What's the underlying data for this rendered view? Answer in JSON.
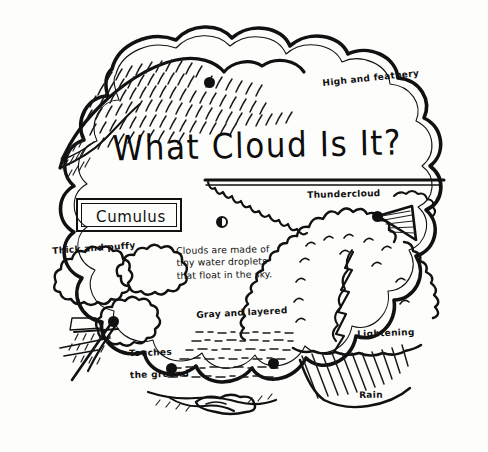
{
  "page": {
    "kind": "hand-drawn cloud identification wheel worksheet",
    "background_color": "#fdfdfb",
    "ink_color": "#111111"
  },
  "title": {
    "text": "What Cloud Is It?"
  },
  "selected_type_box": {
    "label": "Cumulus"
  },
  "center_note": {
    "line1": "Clouds are made of",
    "line2": "tiny water droplets",
    "line3": "that float in the sky."
  },
  "labels": {
    "high_and_feathery": "High and feathery",
    "thundercloud": "Thundercloud",
    "thick_and_puffy": "Thick and puffy",
    "touches_the_ground_line1": "Touches",
    "touches_the_ground_line2": "the ground",
    "gray_and_layered": "Gray and layered",
    "lightening": "Lightening",
    "rain": "Rain"
  },
  "markers": {
    "hole": "center-pivot-hole",
    "dots": [
      "cirrus-pointer-dot",
      "thundercloud-pointer-dot",
      "cumulus-pointer-dot",
      "stratus-left-pointer-dot",
      "stratus-right-pointer-dot"
    ]
  }
}
